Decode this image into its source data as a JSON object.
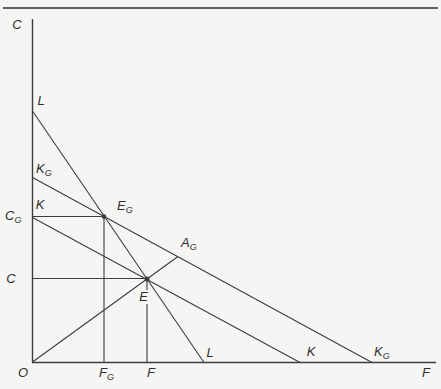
{
  "figure": {
    "background": "#f5f5f3",
    "line_color": "#3d3d3d",
    "text_color": "#2e2e2e",
    "rule_color": "#2c2c2c"
  },
  "axes": {
    "vertical_title": "C",
    "horizontal_title": "F",
    "origin": "O"
  },
  "y_axis_labels": {
    "l": "L",
    "kg_main": "K",
    "kg_sub": "G",
    "k": "K",
    "cg_main": "C",
    "cg_sub": "G",
    "c": "C"
  },
  "x_axis_labels": {
    "fg_main": "F",
    "fg_sub": "G",
    "f": "F",
    "l": "L",
    "k": "K",
    "kg_main": "K",
    "kg_sub": "G"
  },
  "point_labels": {
    "eg_main": "E",
    "eg_sub": "G",
    "ag_main": "A",
    "ag_sub": "G",
    "e": "E"
  }
}
